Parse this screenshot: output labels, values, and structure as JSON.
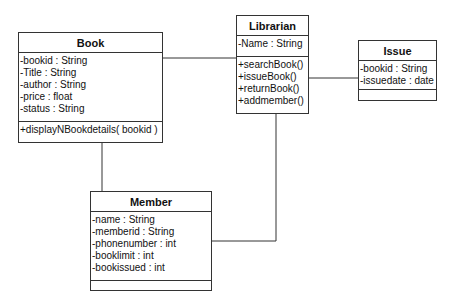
{
  "diagram": {
    "type": "UML class diagram",
    "classes": {
      "book": {
        "name": "Book",
        "attributes": [
          "-bookid : String",
          "-Title : String",
          "-author : String",
          "-price : float",
          "-status : String"
        ],
        "methods": [
          "+displayNBookdetails( bookid )"
        ]
      },
      "librarian": {
        "name": "Librarian",
        "attributes": [
          "-Name : String"
        ],
        "methods": [
          "+searchBook()",
          "+issueBook()",
          "+returnBook()",
          "+addmember()"
        ]
      },
      "issue": {
        "name": "Issue",
        "attributes": [
          "-bookid : String",
          "-issuedate : date"
        ],
        "methods": []
      },
      "member": {
        "name": "Member",
        "attributes": [
          "-name : String",
          "-memberid : String",
          "-phonenumber : int",
          "-booklimit : int",
          "-bookissued : int"
        ],
        "methods": []
      }
    },
    "associations": [
      {
        "from": "Book",
        "to": "Librarian"
      },
      {
        "from": "Librarian",
        "to": "Issue"
      },
      {
        "from": "Book",
        "to": "Member"
      },
      {
        "from": "Librarian",
        "to": "Member"
      }
    ],
    "colors": {
      "line": "#333333",
      "background": "#ffffff",
      "text": "#111111"
    }
  }
}
